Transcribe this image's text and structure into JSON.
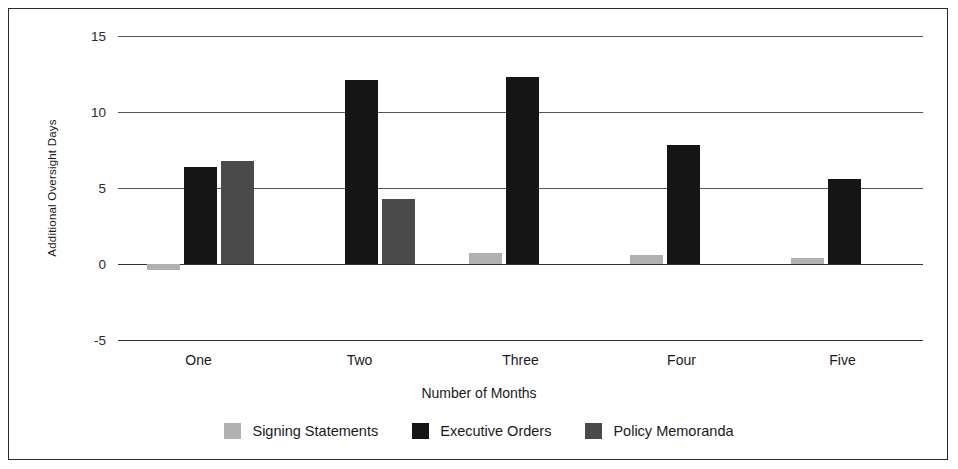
{
  "chart_data": {
    "type": "bar",
    "title": "",
    "subtitle": "",
    "xlabel": "Number of Months",
    "ylabel": "Additional Oversight Days",
    "categories": [
      "One",
      "Two",
      "Three",
      "Four",
      "Five"
    ],
    "series": [
      {
        "name": "Signing Statements",
        "color": "#b0b0b0",
        "values": [
          -0.4,
          0,
          0.7,
          0.6,
          0.4
        ]
      },
      {
        "name": "Executive Orders",
        "color": "#151515",
        "values": [
          6.4,
          12.1,
          12.3,
          7.8,
          5.6
        ]
      },
      {
        "name": "Policy Memoranda",
        "color": "#4a4a4a",
        "values": [
          6.8,
          4.3,
          0,
          0,
          0
        ]
      }
    ],
    "ylim": [
      -5,
      15
    ],
    "yticks": [
      15,
      10,
      5,
      0,
      -5
    ],
    "ytick_labels": [
      "15",
      "10",
      "5",
      "0",
      "-5"
    ],
    "grid": true,
    "legend_position": "bottom",
    "background_color": "#ffffff",
    "border_color": "#2b2b2b"
  }
}
